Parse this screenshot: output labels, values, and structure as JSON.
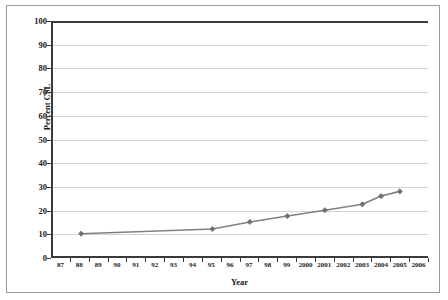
{
  "chart_data": {
    "type": "line",
    "title": "",
    "xlabel": "Year",
    "ylabel": "Percent CSL",
    "xlim": [
      87,
      2006
    ],
    "ylim": [
      0,
      100
    ],
    "grid": true,
    "legend": false,
    "x_tick_labels": [
      "87",
      "88",
      "89",
      "90",
      "91",
      "92",
      "93",
      "94",
      "95",
      "96",
      "97",
      "98",
      "99",
      "2000",
      "2001",
      "2002",
      "2003",
      "2004",
      "2005",
      "2006"
    ],
    "y_tick_labels": [
      "0",
      "10",
      "20",
      "30",
      "40",
      "50",
      "60",
      "70",
      "80",
      "90",
      "100"
    ],
    "y_ticks": [
      0,
      10,
      20,
      30,
      40,
      50,
      60,
      70,
      80,
      90,
      100
    ],
    "series": [
      {
        "name": "Percent CSL",
        "color": "#808080",
        "marker": "diamond",
        "points": [
          {
            "x": "88",
            "y": 9.5
          },
          {
            "x": "95",
            "y": 11.5
          },
          {
            "x": "97",
            "y": 14.5
          },
          {
            "x": "99",
            "y": 17.0
          },
          {
            "x": "2001",
            "y": 19.5
          },
          {
            "x": "2003",
            "y": 22.0
          },
          {
            "x": "2004",
            "y": 25.5
          },
          {
            "x": "2005",
            "y": 27.5
          }
        ]
      }
    ]
  },
  "style": {
    "line_color": "#808080",
    "marker_color": "#707070",
    "axis_color": "#3a3a3a",
    "grid_color": "#d4d4d4",
    "border_color": "#9a9a9a",
    "text_color": "#1a1a1a",
    "background": "#ffffff"
  }
}
